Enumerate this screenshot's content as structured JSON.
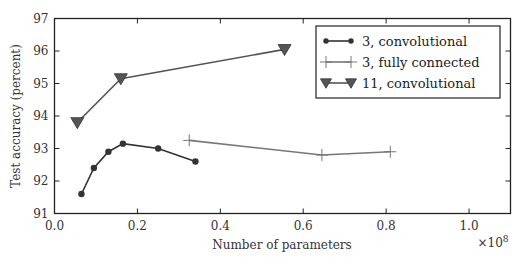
{
  "chart_data": {
    "type": "line",
    "title": "",
    "xlabel": "Number of parameters",
    "ylabel": "Test accuracy (percent)",
    "x_multiplier_label": "×10^8",
    "xlim": [
      0.0,
      1.1
    ],
    "ylim": [
      91,
      97
    ],
    "xticks": [
      "0.0",
      "0.2",
      "0.4",
      "0.6",
      "0.8",
      "1.0"
    ],
    "yticks": [
      "91",
      "92",
      "93",
      "94",
      "95",
      "96",
      "97"
    ],
    "grid": false,
    "legend_position": "upper right",
    "series": [
      {
        "name": "3, convolutional",
        "marker": "circle",
        "color": "#333333",
        "x": [
          0.065,
          0.095,
          0.13,
          0.165,
          0.25,
          0.34
        ],
        "y": [
          91.6,
          92.4,
          92.9,
          93.15,
          93.0,
          92.6
        ]
      },
      {
        "name": "3, fully connected",
        "marker": "plus",
        "color": "#777777",
        "x": [
          0.325,
          0.645,
          0.81
        ],
        "y": [
          93.25,
          92.8,
          92.9
        ]
      },
      {
        "name": "11, convolutional",
        "marker": "triangle-down",
        "color": "#555555",
        "x": [
          0.055,
          0.16,
          0.555
        ],
        "y": [
          93.8,
          95.15,
          96.05
        ]
      }
    ]
  }
}
